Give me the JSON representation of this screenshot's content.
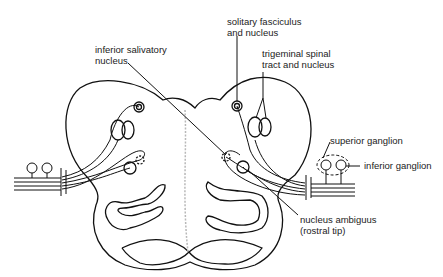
{
  "diagram": {
    "labels": {
      "solitary": "solitary fasciculus\nand nucleus",
      "salivatory": "inferior salivatory\nnucleus",
      "trigeminal": "trigeminal spinal\ntract and nucleus",
      "superior_ganglion": "superior ganglion",
      "inferior_ganglion": "inferior ganglion",
      "ambiguus": "nucleus ambiguus\n(rostral tip)"
    },
    "colors": {
      "line": "#111111",
      "background": "#ffffff",
      "midline": "#b0b0b0"
    }
  }
}
